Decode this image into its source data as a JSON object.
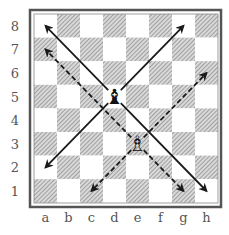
{
  "board": {
    "files": [
      "a",
      "b",
      "c",
      "d",
      "e",
      "f",
      "g",
      "h"
    ],
    "ranks": [
      "8",
      "7",
      "6",
      "5",
      "4",
      "3",
      "2",
      "1"
    ],
    "light_color": "#ffffff",
    "dark_style": "hatched",
    "hatch_color": "#8a8a8a",
    "frame_color": "#333333"
  },
  "pieces": [
    {
      "square": "d5",
      "piece": "bishop",
      "color": "black",
      "glyph": "♝"
    },
    {
      "square": "e3",
      "piece": "bishop",
      "color": "white",
      "glyph": "♗"
    }
  ],
  "arrows": [
    {
      "from": "d5",
      "to": "a8",
      "style": "solid"
    },
    {
      "from": "d5",
      "to": "g8",
      "style": "solid"
    },
    {
      "from": "d5",
      "to": "a2",
      "style": "solid"
    },
    {
      "from": "d5",
      "to": "h1",
      "style": "solid"
    },
    {
      "from": "e3",
      "to": "a7",
      "style": "dashed"
    },
    {
      "from": "e3",
      "to": "h6",
      "style": "dashed"
    },
    {
      "from": "e3",
      "to": "c1",
      "style": "dashed"
    },
    {
      "from": "e3",
      "to": "g1",
      "style": "dashed"
    }
  ]
}
